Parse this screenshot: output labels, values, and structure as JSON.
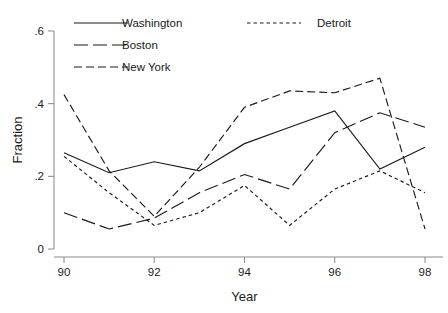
{
  "chart_data": {
    "type": "line",
    "title": "",
    "subtitle": "",
    "xlabel": "Year",
    "ylabel": "Fraction",
    "x": [
      90,
      91,
      92,
      93,
      94,
      95,
      96,
      97,
      98
    ],
    "xtick_labels": [
      "90",
      "92",
      "94",
      "96",
      "98"
    ],
    "xticks": [
      90,
      92,
      94,
      96,
      98
    ],
    "ytick_labels": [
      "0",
      ".2",
      ".4",
      ".6"
    ],
    "yticks": [
      0,
      0.2,
      0.4,
      0.6
    ],
    "xlim": [
      90,
      98
    ],
    "ylim": [
      0,
      0.6
    ],
    "grid": false,
    "legend_position": "top-inside",
    "series": [
      {
        "name": "Washington",
        "dash": "solid",
        "dasharray": "none",
        "color": "#1a1a1a",
        "values": [
          0.265,
          0.21,
          0.24,
          0.215,
          0.29,
          0.335,
          0.38,
          0.22,
          0.28
        ]
      },
      {
        "name": "Boston",
        "dash": "long-dash",
        "dasharray": "14,5",
        "color": "#1a1a1a",
        "values": [
          0.1,
          0.055,
          0.085,
          0.155,
          0.205,
          0.165,
          0.32,
          0.375,
          0.335
        ]
      },
      {
        "name": "New York",
        "dash": "medium-dash",
        "dasharray": "8,4",
        "color": "#1a1a1a",
        "values": [
          0.425,
          0.215,
          0.09,
          0.225,
          0.39,
          0.435,
          0.43,
          0.47,
          0.055
        ]
      },
      {
        "name": "Detroit",
        "dash": "short-dash",
        "dasharray": "3.5,3",
        "color": "#1a1a1a",
        "values": [
          0.255,
          0.155,
          0.065,
          0.1,
          0.175,
          0.065,
          0.165,
          0.215,
          0.155
        ]
      }
    ]
  },
  "legend": {
    "entries": [
      {
        "label": "Washington"
      },
      {
        "label": "Detroit"
      },
      {
        "label": "Boston"
      },
      {
        "label": "New York"
      }
    ]
  },
  "axes": {
    "x_title": "Year",
    "y_title": "Fraction"
  }
}
